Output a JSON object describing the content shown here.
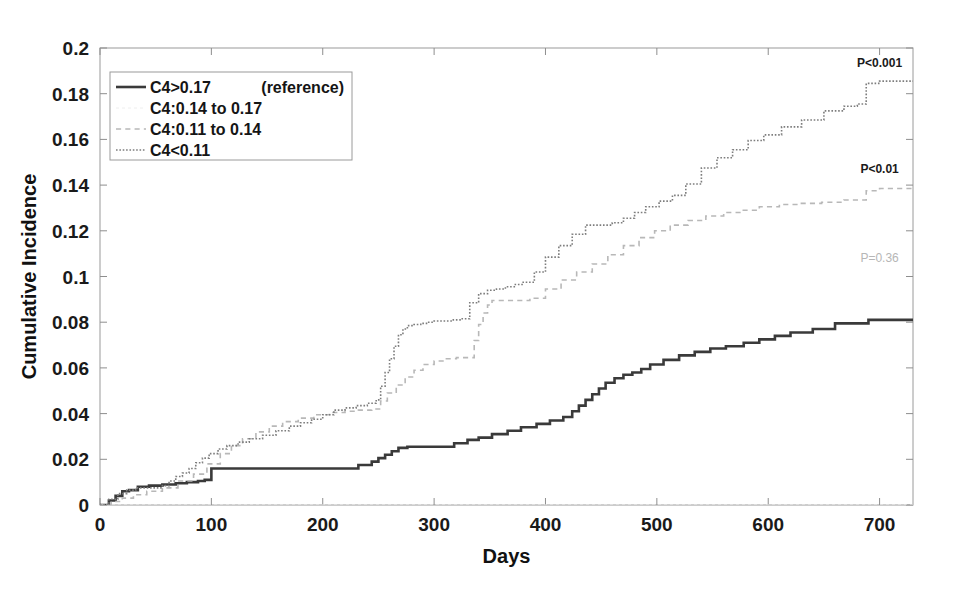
{
  "chart_data": {
    "type": "line",
    "title": "",
    "subtitle": "",
    "xlabel": "Days",
    "ylabel": "Cumulative Incidence",
    "xlim": [
      0,
      730
    ],
    "ylim": [
      0,
      0.2
    ],
    "xticks": [
      0,
      100,
      200,
      300,
      400,
      500,
      600,
      700
    ],
    "xtick_labels": [
      "0",
      "100",
      "200",
      "300",
      "400",
      "500",
      "600",
      "700"
    ],
    "yticks": [
      0,
      0.02,
      0.04,
      0.06,
      0.08,
      0.1,
      0.12,
      0.14,
      0.16,
      0.18,
      0.2
    ],
    "ytick_labels": [
      "0",
      "0.02",
      "0.04",
      "0.06",
      "0.08",
      "0.1",
      "0.12",
      "0.14",
      "0.16",
      "0.18",
      "0.2"
    ],
    "grid": false,
    "legend_position": "upper-left",
    "step_style": "post",
    "series": [
      {
        "name": "C4>0.17",
        "note": "(reference)",
        "style": "solid",
        "color": "#3a3a3a",
        "width": 2.6,
        "x": [
          0,
          8,
          14,
          20,
          26,
          34,
          44,
          56,
          68,
          78,
          88,
          94,
          100,
          122,
          130,
          175,
          210,
          232,
          244,
          250,
          256,
          262,
          268,
          276,
          284,
          300,
          318,
          330,
          340,
          352,
          366,
          378,
          392,
          404,
          416,
          424,
          430,
          436,
          442,
          448,
          454,
          462,
          470,
          478,
          486,
          494,
          506,
          520,
          534,
          548,
          562,
          578,
          592,
          606,
          620,
          640,
          660,
          690,
          730
        ],
        "y": [
          0,
          0.002,
          0.004,
          0.006,
          0.0065,
          0.008,
          0.0085,
          0.009,
          0.0095,
          0.01,
          0.0105,
          0.011,
          0.016,
          0.016,
          0.016,
          0.016,
          0.016,
          0.0175,
          0.019,
          0.0205,
          0.022,
          0.0235,
          0.025,
          0.0255,
          0.0255,
          0.0255,
          0.027,
          0.0285,
          0.0295,
          0.031,
          0.0325,
          0.034,
          0.0355,
          0.037,
          0.0385,
          0.041,
          0.0435,
          0.046,
          0.0485,
          0.051,
          0.0535,
          0.0555,
          0.057,
          0.058,
          0.0595,
          0.0615,
          0.0635,
          0.0655,
          0.067,
          0.0685,
          0.0695,
          0.071,
          0.0725,
          0.074,
          0.0755,
          0.077,
          0.0795,
          0.081,
          0.081
        ]
      },
      {
        "name": "C4:0.14 to 0.17",
        "note": "",
        "style": "faint-dash",
        "color": "#eeeeee",
        "width": 1.0,
        "x": [
          0,
          730
        ],
        "y": [
          0,
          0
        ]
      },
      {
        "name": "C4:0.11 to 0.14",
        "note": "",
        "style": "dashed",
        "color": "#b8b8b8",
        "width": 1.6,
        "x": [
          0,
          10,
          20,
          30,
          42,
          56,
          70,
          84,
          96,
          108,
          118,
          128,
          140,
          152,
          164,
          178,
          192,
          206,
          220,
          232,
          244,
          252,
          258,
          266,
          274,
          282,
          290,
          300,
          310,
          320,
          330,
          336,
          340,
          344,
          348,
          352,
          360,
          372,
          386,
          400,
          414,
          428,
          442,
          456,
          470,
          484,
          498,
          512,
          528,
          544,
          560,
          576,
          592,
          610,
          628,
          648,
          668,
          688,
          700,
          730
        ],
        "y": [
          0,
          0.0015,
          0.003,
          0.0045,
          0.006,
          0.0075,
          0.0105,
          0.0135,
          0.018,
          0.0225,
          0.026,
          0.029,
          0.032,
          0.0345,
          0.0365,
          0.038,
          0.0395,
          0.0405,
          0.041,
          0.0415,
          0.042,
          0.0455,
          0.049,
          0.0525,
          0.056,
          0.059,
          0.0615,
          0.063,
          0.064,
          0.0645,
          0.0645,
          0.072,
          0.079,
          0.084,
          0.0875,
          0.0895,
          0.0895,
          0.0895,
          0.0905,
          0.0945,
          0.0985,
          0.102,
          0.1055,
          0.1095,
          0.1135,
          0.117,
          0.12,
          0.1225,
          0.1245,
          0.1265,
          0.128,
          0.129,
          0.1305,
          0.1315,
          0.132,
          0.1325,
          0.1335,
          0.1375,
          0.1385,
          0.1385
        ]
      },
      {
        "name": "C4<0.11",
        "note": "",
        "style": "dotted",
        "color": "#7d7d7d",
        "width": 1.6,
        "x": [
          0,
          8,
          16,
          24,
          32,
          40,
          48,
          56,
          62,
          68,
          74,
          80,
          86,
          92,
          98,
          106,
          114,
          124,
          134,
          146,
          158,
          170,
          180,
          190,
          200,
          210,
          220,
          230,
          240,
          248,
          252,
          256,
          260,
          264,
          268,
          272,
          276,
          282,
          288,
          294,
          300,
          308,
          316,
          324,
          332,
          340,
          348,
          356,
          364,
          372,
          380,
          390,
          400,
          412,
          424,
          436,
          448,
          460,
          470,
          480,
          490,
          502,
          514,
          526,
          540,
          554,
          568,
          582,
          596,
          612,
          630,
          650,
          668,
          680,
          688,
          700,
          730
        ],
        "y": [
          0,
          0.0025,
          0.005,
          0.0065,
          0.0075,
          0.0075,
          0.0075,
          0.0085,
          0.0105,
          0.0125,
          0.014,
          0.016,
          0.0185,
          0.0205,
          0.0225,
          0.0245,
          0.026,
          0.0275,
          0.029,
          0.0305,
          0.0325,
          0.0345,
          0.036,
          0.0375,
          0.0395,
          0.0415,
          0.0425,
          0.0435,
          0.0445,
          0.046,
          0.052,
          0.058,
          0.064,
          0.0695,
          0.0745,
          0.077,
          0.0785,
          0.079,
          0.0795,
          0.08,
          0.0805,
          0.0805,
          0.081,
          0.0815,
          0.0885,
          0.0925,
          0.094,
          0.0945,
          0.0955,
          0.0965,
          0.0975,
          0.102,
          0.1085,
          0.1135,
          0.1185,
          0.1225,
          0.1225,
          0.1235,
          0.1255,
          0.128,
          0.1305,
          0.133,
          0.1355,
          0.1405,
          0.1475,
          0.152,
          0.1555,
          0.1595,
          0.162,
          0.1655,
          0.1685,
          0.1725,
          0.1745,
          0.1755,
          0.1845,
          0.1855,
          0.1855
        ]
      }
    ],
    "annotations": [
      {
        "text": "P<0.001",
        "x": 700,
        "y": 0.1915,
        "style": "strong",
        "name": "p-value-c4-lt-011"
      },
      {
        "text": "P<0.01",
        "x": 700,
        "y": 0.1455,
        "style": "strong",
        "name": "p-value-c4-011-to-014"
      },
      {
        "text": "P=0.36",
        "x": 700,
        "y": 0.1065,
        "style": "faint",
        "name": "p-value-c4-014-to-017"
      }
    ],
    "legend": {
      "entries": [
        {
          "label": "C4>0.17",
          "note": "(reference)",
          "style": "solid"
        },
        {
          "label": "C4:0.14 to 0.17",
          "note": "",
          "style": "faint-dash"
        },
        {
          "label": "C4:0.11 to 0.14",
          "note": "",
          "style": "dashed"
        },
        {
          "label": "C4<0.11",
          "note": "",
          "style": "dotted"
        }
      ]
    }
  }
}
